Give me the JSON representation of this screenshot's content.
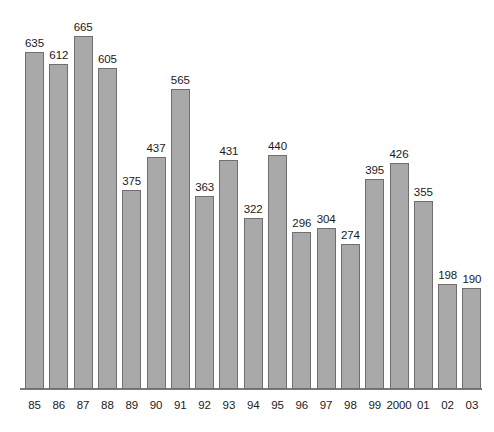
{
  "chart_data": {
    "type": "bar",
    "title": "",
    "subtitle": "",
    "xlabel": "",
    "ylabel": "",
    "categories": [
      "85",
      "86",
      "87",
      "88",
      "89",
      "90",
      "91",
      "92",
      "93",
      "94",
      "95",
      "96",
      "97",
      "98",
      "99",
      "2000",
      "01",
      "02",
      "03"
    ],
    "values": [
      635,
      612,
      665,
      605,
      375,
      437,
      565,
      363,
      431,
      322,
      440,
      296,
      304,
      274,
      395,
      426,
      355,
      198,
      190
    ],
    "value_labels": [
      "635",
      "612",
      "665",
      "605",
      "375",
      "437",
      "565",
      "363",
      "431",
      "322",
      "440",
      "296",
      "304",
      "274",
      "395",
      "426",
      "355",
      "198",
      "190"
    ],
    "ylim": [
      0,
      665
    ],
    "grid": false,
    "legend": null,
    "bar_color": "#a9a9a9",
    "bar_border_color": "#6f6f6f",
    "axis_color": "#7a7a7a",
    "background_color": "#ffffff",
    "annotations": []
  }
}
